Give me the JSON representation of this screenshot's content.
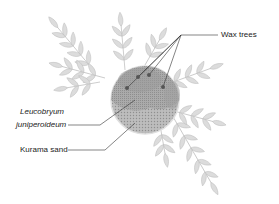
{
  "diagram": {
    "labels": {
      "wax_trees": "Wax trees",
      "leucobryum_line1": "Leucobryum",
      "leucobryum_line2": "juniperoideum",
      "kurama_sand": "Kurama sand"
    },
    "colors": {
      "leaf_fill": "#d9d9d9",
      "leaf_stroke": "#bdbdbd",
      "circle_outer": "#c8c8c8",
      "circle_inner": "#a6a6a6",
      "leader_line": "#333333",
      "dot": "#555555"
    }
  }
}
